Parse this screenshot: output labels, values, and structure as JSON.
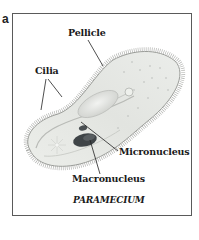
{
  "figure": {
    "panel_letter": "a",
    "caption": "PARAMECIUM",
    "labels": {
      "pellicle": "Pellicle",
      "cilia": "Cilia",
      "micronucleus": "Micronucleus",
      "macronucleus": "Macronucleus"
    },
    "colors": {
      "frame": "#5a5a5a",
      "cell_body": "#e6e8e4",
      "cell_outline": "#9a9c98",
      "cilia": "#8e908c",
      "macronucleus": "#3f4447",
      "micronucleus": "#4a4f52",
      "leader_line": "#222222"
    }
  }
}
